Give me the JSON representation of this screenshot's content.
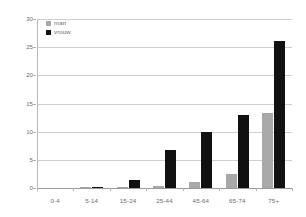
{
  "chart_data": {
    "type": "bar",
    "title": "",
    "subtitle": "",
    "xlabel": "",
    "ylabel": "",
    "categories": [
      "0-4",
      "5-14",
      "15-24",
      "25-44",
      "45-64",
      "65-74",
      "75+"
    ],
    "series": [
      {
        "name": "man",
        "color": "#a8a8a8",
        "values": [
          0,
          0.15,
          0.05,
          0.3,
          1.0,
          2.5,
          13.3
        ]
      },
      {
        "name": "vrouw",
        "color": "#111111",
        "values": [
          0,
          0.15,
          1.5,
          6.8,
          10.0,
          13.0,
          26.1
        ]
      }
    ],
    "ylim": [
      0,
      30
    ],
    "yticks": [
      0,
      5,
      10,
      15,
      20,
      25,
      30
    ],
    "ytick_labels": [
      "0",
      "5",
      "10",
      "15",
      "20",
      "25",
      "30"
    ],
    "grid": true,
    "grid_axis": "y",
    "legend_position": "top-left-inside",
    "annotations": []
  },
  "legend": {
    "items": [
      {
        "label": "man"
      },
      {
        "label": "vrouw"
      }
    ]
  },
  "colors": {
    "series_man": "#a8a8a8",
    "series_vrouw": "#111111",
    "gridline": "#cfcfcf",
    "axis": "#9a9a9a",
    "tick_text": "#6d6d6d",
    "background": "#ffffff"
  }
}
